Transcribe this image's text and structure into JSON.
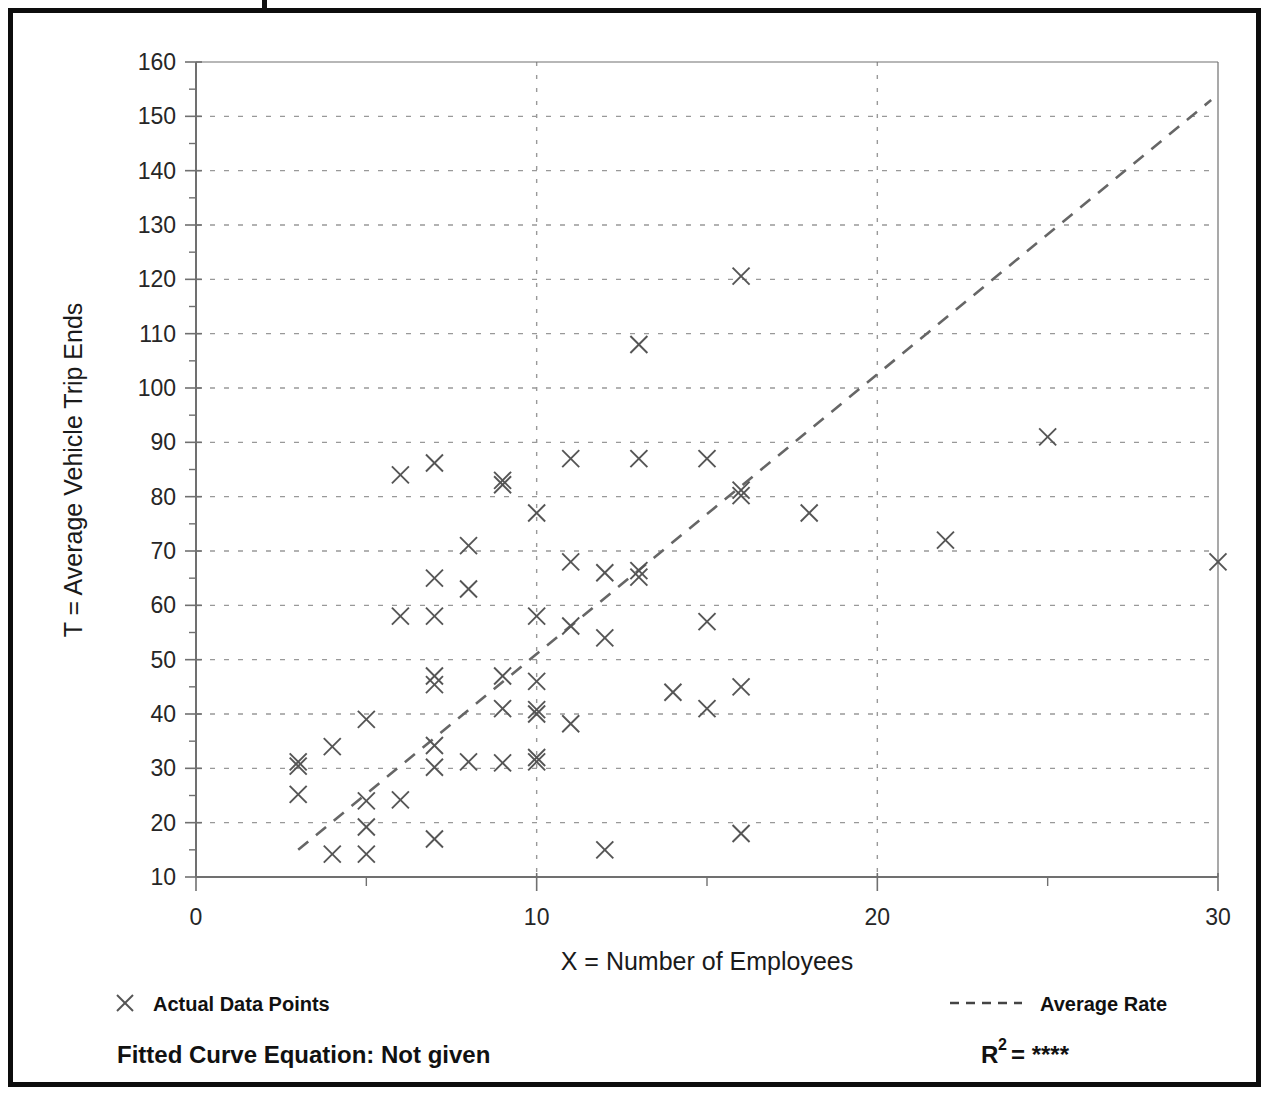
{
  "figure": {
    "frame_color": "#0d0d0d",
    "plot_bg": "#ffffff",
    "marker_color": "#555555",
    "gridline_color": "#999999",
    "axis_color": "#707070"
  },
  "axes": {
    "x_title": "X = Number of Employees",
    "y_title": "T = Average Vehicle Trip Ends",
    "x_ticks": [
      "0",
      "10",
      "20",
      "30"
    ],
    "y_ticks": [
      "10",
      "20",
      "30",
      "40",
      "50",
      "60",
      "70",
      "80",
      "90",
      "100",
      "110",
      "120",
      "130",
      "140",
      "150",
      "160"
    ]
  },
  "legend": {
    "data_points_label": "Actual Data Points",
    "data_points_marker": "x-marker-icon",
    "average_rate_label": "Average Rate",
    "average_rate_marker": "dashed-line-icon"
  },
  "footer": {
    "equation_label": "Fitted Curve Equation:  Not given",
    "r2_prefix": "R",
    "r2_exponent": "2",
    "r2_value": "= ****"
  },
  "chart_data": {
    "type": "scatter",
    "title": "",
    "xlabel": "X = Number of Employees",
    "ylabel": "T = Average Vehicle Trip Ends",
    "xlim": [
      0,
      30
    ],
    "ylim": [
      10,
      160
    ],
    "xticks": [
      0,
      10,
      20,
      30
    ],
    "xminorticks": [
      5,
      15,
      25
    ],
    "yticks": [
      10,
      20,
      30,
      40,
      50,
      60,
      70,
      80,
      90,
      100,
      110,
      120,
      130,
      140,
      150,
      160
    ],
    "grid": true,
    "grid_style": "dotted",
    "legend_position": "below-axes",
    "series": [
      {
        "name": "Actual Data Points",
        "marker": "x",
        "color": "#555555",
        "points": [
          [
            3,
            31.2
          ],
          [
            3,
            30.4
          ],
          [
            3,
            25.2
          ],
          [
            4,
            34.0
          ],
          [
            4,
            14.2
          ],
          [
            5,
            39.0
          ],
          [
            5,
            24.0
          ],
          [
            5,
            19.2
          ],
          [
            5,
            14.2
          ],
          [
            6,
            84.0
          ],
          [
            6,
            58.0
          ],
          [
            6,
            24.2
          ],
          [
            7,
            86.2
          ],
          [
            7,
            65.0
          ],
          [
            7,
            58.0
          ],
          [
            7,
            47.0
          ],
          [
            7,
            45.4
          ],
          [
            7,
            34.2
          ],
          [
            7,
            30.2
          ],
          [
            7,
            17.0
          ],
          [
            8,
            71.0
          ],
          [
            8,
            63.0
          ],
          [
            8,
            31.2
          ],
          [
            9,
            83.0
          ],
          [
            9,
            82.2
          ],
          [
            9,
            47.0
          ],
          [
            9,
            41.0
          ],
          [
            9,
            31.0
          ],
          [
            10,
            77.0
          ],
          [
            10,
            58.0
          ],
          [
            10,
            46.0
          ],
          [
            10,
            40.8
          ],
          [
            10,
            40.0
          ],
          [
            10,
            32.0
          ],
          [
            10,
            31.2
          ],
          [
            11,
            87.0
          ],
          [
            11,
            68.0
          ],
          [
            11,
            56.2
          ],
          [
            11,
            38.2
          ],
          [
            12,
            66.0
          ],
          [
            12,
            54.0
          ],
          [
            12,
            15.0
          ],
          [
            13,
            108.0
          ],
          [
            13,
            87.0
          ],
          [
            13,
            66.4
          ],
          [
            13,
            65.2
          ],
          [
            14,
            44.0
          ],
          [
            15,
            87.0
          ],
          [
            15,
            57.0
          ],
          [
            15,
            41.0
          ],
          [
            16,
            120.6
          ],
          [
            16,
            81.2
          ],
          [
            16,
            80.2
          ],
          [
            16,
            45.0
          ],
          [
            16,
            18.0
          ],
          [
            18,
            77.0
          ],
          [
            22,
            72.0
          ],
          [
            25,
            91.0
          ],
          [
            30,
            68.0
          ]
        ]
      }
    ],
    "trend_line": {
      "name": "Average Rate",
      "style": "dashed",
      "color": "#666666",
      "start": [
        3.0,
        15.0
      ],
      "end": [
        29.8,
        153.0
      ]
    },
    "annotations": {
      "fitted_curve_equation": "Not given",
      "r_squared": "****"
    }
  }
}
